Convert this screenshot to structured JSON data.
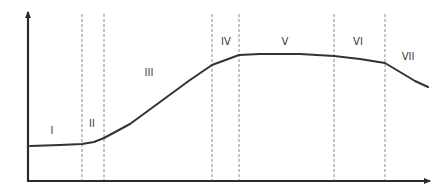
{
  "chart_data": {
    "type": "line",
    "title": "",
    "xlabel": "",
    "ylabel": "",
    "grid": false,
    "axes": {
      "x_arrow": true,
      "y_arrow": true,
      "ticks": false
    },
    "phase_boundaries_px": [
      82,
      104,
      212,
      239,
      334,
      385
    ],
    "phases": [
      {
        "label": "I",
        "x": 52,
        "y": 134
      },
      {
        "label": "II",
        "x": 92,
        "y": 127
      },
      {
        "label": "III",
        "x": 149,
        "y": 76
      },
      {
        "label": "IV",
        "x": 226,
        "y": 45
      },
      {
        "label": "V",
        "x": 285,
        "y": 45
      },
      {
        "label": "VI",
        "x": 358,
        "y": 45
      },
      {
        "label": "VII",
        "x": 408,
        "y": 60
      }
    ],
    "curve_points_px": [
      [
        30,
        146
      ],
      [
        60,
        145
      ],
      [
        82,
        144
      ],
      [
        94,
        142
      ],
      [
        104,
        138
      ],
      [
        130,
        124
      ],
      [
        160,
        102
      ],
      [
        190,
        80
      ],
      [
        212,
        65
      ],
      [
        239,
        55
      ],
      [
        260,
        54
      ],
      [
        300,
        54
      ],
      [
        334,
        56
      ],
      [
        360,
        59
      ],
      [
        385,
        63
      ],
      [
        400,
        72
      ],
      [
        415,
        81
      ],
      [
        428,
        87
      ]
    ],
    "colors": {
      "curve": "#333333",
      "axes": "#2b2b2b",
      "dashed": "#8a8a8a"
    }
  }
}
